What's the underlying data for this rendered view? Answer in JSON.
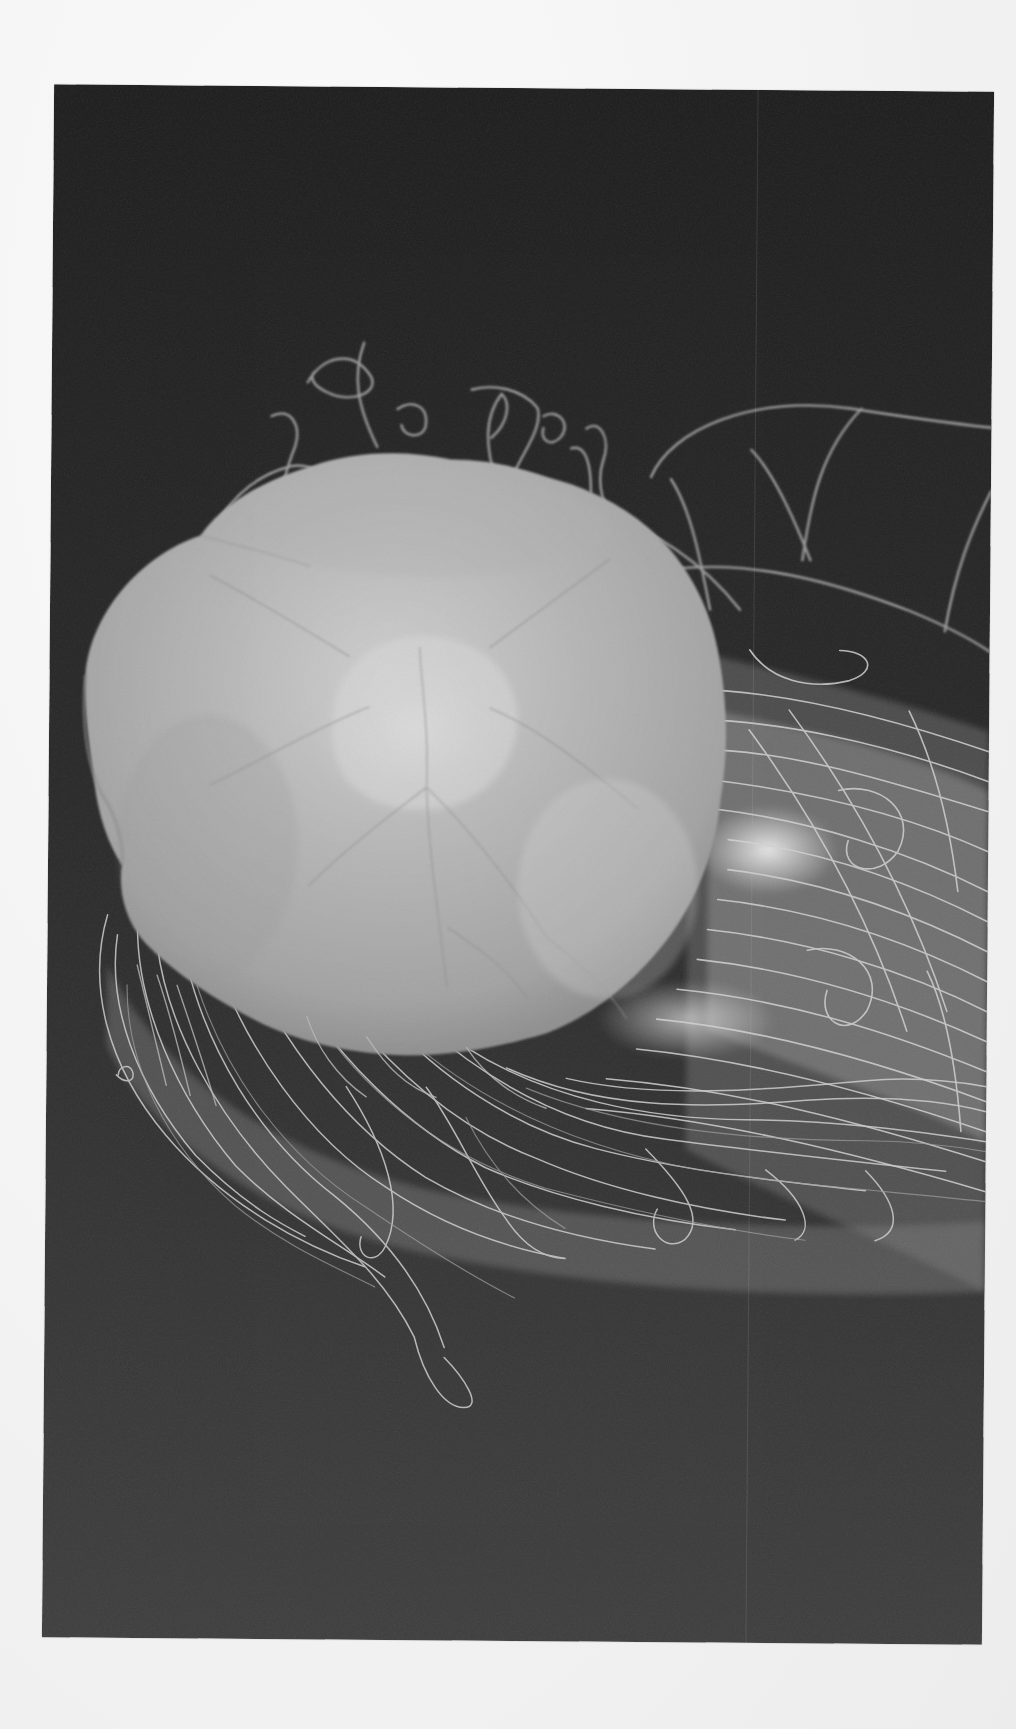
{
  "image": {
    "subject": "jellyfish",
    "description": "Scanned printed photograph of a pale jellyfish bell with a dense mass of trailing tentacles on a dark background",
    "colors": {
      "paper": "#f4f4f4",
      "background_top": "#1b1b1b",
      "background_bottom": "#3b3b3b",
      "bell_light": "#d6d6d6",
      "bell_mid": "#a9a9a9",
      "bell_shadow": "#8c8c8c",
      "tentacle": "#d9d9d9",
      "tentacle_dim": "#8f8f8f"
    },
    "frame": {
      "left": 48,
      "top": 88,
      "width": 940,
      "height": 1553,
      "rotation_deg": 0.45
    },
    "scan_line_x": 704
  }
}
